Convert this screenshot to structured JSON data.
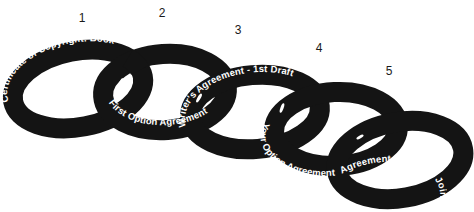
{
  "diagram": {
    "type": "chain-of-links",
    "colors": {
      "link": "#141414",
      "text": "#ffffff",
      "number": "#1a1a1a",
      "background": "#ffffff"
    },
    "links": [
      {
        "number": "1",
        "label": "Certificate of Copyright: Book"
      },
      {
        "number": "2",
        "label": "First Option Agreement"
      },
      {
        "number": "3",
        "label": "Writer's Agreement - 1st Draft"
      },
      {
        "number": "4",
        "label": "Your Option Agreement"
      },
      {
        "number": "5",
        "label": "Agreement with your Joint Producer"
      }
    ]
  }
}
